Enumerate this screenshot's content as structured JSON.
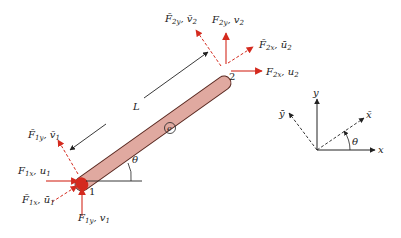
{
  "diagram": {
    "type": "finite-element-bar-in-2d",
    "element": {
      "label": "e",
      "length_label": "L",
      "angle_label": "θ",
      "fill_color": "#e0a9a0",
      "stroke_color": "#5a2a22"
    },
    "nodes": [
      {
        "id": "1",
        "label": "1"
      },
      {
        "id": "2",
        "label": "2"
      }
    ],
    "force_labels": {
      "n1_local_y": {
        "F": "F̄",
        "sub": "1y",
        "d": "v̄",
        "dsub": "1"
      },
      "n1_global_x": {
        "F": "F",
        "sub": "1x",
        "d": "u",
        "dsub": "1"
      },
      "n1_local_x": {
        "F": "F̄",
        "sub": "1x",
        "d": "ū",
        "dsub": "1"
      },
      "n1_global_y": {
        "F": "F",
        "sub": "1y",
        "d": "v",
        "dsub": "1"
      },
      "n2_local_y": {
        "F": "F̄",
        "sub": "2y",
        "d": "v̄",
        "dsub": "2"
      },
      "n2_global_y": {
        "F": "F",
        "sub": "2y",
        "d": "v",
        "dsub": "2"
      },
      "n2_local_x": {
        "F": "F̄",
        "sub": "2x",
        "d": "ū",
        "dsub": "2"
      },
      "n2_global_x": {
        "F": "F",
        "sub": "2x",
        "d": "u",
        "dsub": "2"
      }
    },
    "coordinate_system": {
      "x": "x",
      "y": "y",
      "x_bar": "x̄",
      "y_bar": "ȳ",
      "angle": "θ"
    },
    "colors": {
      "force_arrow": "#d42a1e",
      "axis": "#222222",
      "bar_fill": "#e0a9a0"
    }
  }
}
